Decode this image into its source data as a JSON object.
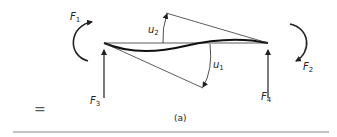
{
  "figure": {
    "caption": "(a)",
    "equals_sign": "=",
    "labels": {
      "F1": {
        "base": "F",
        "sub": "1"
      },
      "F2": {
        "base": "F",
        "sub": "2"
      },
      "F3": {
        "base": "F",
        "sub": "3"
      },
      "F4": {
        "base": "F",
        "sub": "4"
      },
      "u1": {
        "base": "u",
        "sub": "1"
      },
      "u2": {
        "base": "u",
        "sub": "2"
      }
    },
    "colors": {
      "ink": "#222222",
      "rule": "#888888",
      "background": "#ffffff"
    }
  }
}
